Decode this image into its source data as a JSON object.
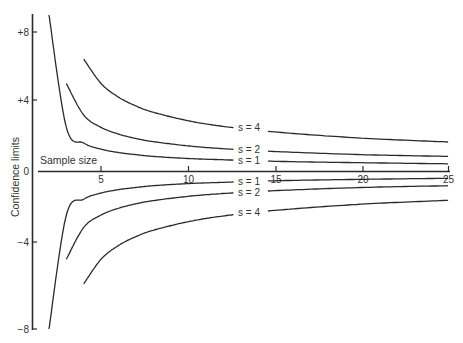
{
  "chart_data": {
    "type": "line",
    "title": "",
    "xlabel": "Sample size",
    "ylabel": "Confidence limits",
    "xlim": [
      1,
      25
    ],
    "ylim": [
      -8,
      8
    ],
    "grid": false,
    "legend": "inline labels at right-center of curves",
    "x_ticks": [
      5,
      10,
      15,
      20,
      25
    ],
    "x_tick_labels": [
      "5",
      "10",
      "15",
      "20",
      "25"
    ],
    "y_ticks": [
      8,
      4,
      0,
      -4,
      -8
    ],
    "y_tick_labels": [
      "+8",
      "+4",
      "0",
      "−4",
      "−8"
    ],
    "series": [
      {
        "name": "s = 1",
        "branch": "upper",
        "x": [
          2,
          3,
          4,
          5,
          6,
          7,
          8,
          10,
          12,
          15,
          20,
          25
        ],
        "values": [
          9.0,
          2.48,
          1.59,
          1.24,
          1.05,
          0.93,
          0.83,
          0.71,
          0.64,
          0.55,
          0.47,
          0.41
        ]
      },
      {
        "name": "s = 2",
        "branch": "upper",
        "x": [
          3,
          4,
          5,
          6,
          7,
          8,
          10,
          12,
          15,
          20,
          25
        ],
        "values": [
          4.97,
          3.18,
          2.48,
          2.1,
          1.85,
          1.67,
          1.43,
          1.27,
          1.11,
          0.93,
          0.83
        ]
      },
      {
        "name": "s = 4",
        "branch": "upper",
        "x": [
          4,
          5,
          6,
          7,
          8,
          10,
          12,
          15,
          20,
          25
        ],
        "values": [
          6.36,
          4.97,
          4.2,
          3.7,
          3.34,
          2.86,
          2.54,
          2.22,
          1.87,
          1.65
        ]
      },
      {
        "name": "s = 1",
        "branch": "lower",
        "x": [
          2,
          3,
          4,
          5,
          6,
          7,
          8,
          10,
          12,
          15,
          20,
          25
        ],
        "values": [
          -9.0,
          -2.48,
          -1.59,
          -1.24,
          -1.05,
          -0.93,
          -0.83,
          -0.71,
          -0.64,
          -0.55,
          -0.47,
          -0.41
        ]
      },
      {
        "name": "s = 2",
        "branch": "lower",
        "x": [
          3,
          4,
          5,
          6,
          7,
          8,
          10,
          12,
          15,
          20,
          25
        ],
        "values": [
          -4.97,
          -3.18,
          -2.48,
          -2.1,
          -1.85,
          -1.67,
          -1.43,
          -1.27,
          -1.11,
          -0.93,
          -0.83
        ]
      },
      {
        "name": "s = 4",
        "branch": "lower",
        "x": [
          4,
          5,
          6,
          7,
          8,
          10,
          12,
          15,
          20,
          25
        ],
        "values": [
          -6.36,
          -4.97,
          -4.2,
          -3.7,
          -3.34,
          -2.86,
          -2.54,
          -2.22,
          -1.87,
          -1.65
        ]
      }
    ],
    "series_labels": {
      "upper_s4": "s = 4",
      "upper_s2": "s = 2",
      "upper_s1": "s = 1",
      "lower_s1": "s = 1",
      "lower_s2": "s = 2",
      "lower_s4": "s = 4"
    },
    "colors": {
      "line": "#2a2a2a",
      "axis": "#2a2a2a",
      "text": "#333333",
      "background": "#ffffff"
    }
  }
}
